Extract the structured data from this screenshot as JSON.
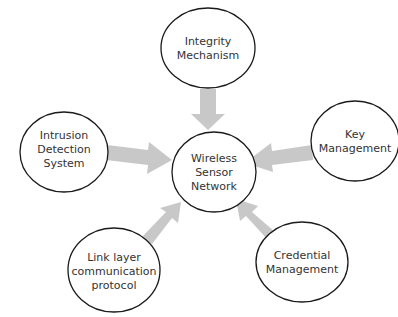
{
  "diagram": {
    "type": "hub-and-spoke",
    "center": {
      "id": "wsn",
      "lines": [
        "Wireless",
        "Sensor",
        "Network"
      ]
    },
    "nodes": [
      {
        "id": "integrity",
        "lines": [
          "Integrity",
          "Mechanism"
        ]
      },
      {
        "id": "intrusion",
        "lines": [
          "Intrusion",
          "Detection",
          "System"
        ]
      },
      {
        "id": "key",
        "lines": [
          "Key",
          "Management"
        ]
      },
      {
        "id": "link",
        "lines": [
          "Link layer",
          "communication",
          "protocol"
        ]
      },
      {
        "id": "credential",
        "lines": [
          "Credential",
          "Management"
        ]
      }
    ],
    "edges": [
      {
        "from": "integrity",
        "to": "wsn"
      },
      {
        "from": "intrusion",
        "to": "wsn"
      },
      {
        "from": "key",
        "to": "wsn"
      },
      {
        "from": "link",
        "to": "wsn"
      },
      {
        "from": "credential",
        "to": "wsn"
      }
    ],
    "colors": {
      "arrow": "#c8c8c8",
      "outline": "#1a1a1a",
      "text": "#333333"
    }
  }
}
